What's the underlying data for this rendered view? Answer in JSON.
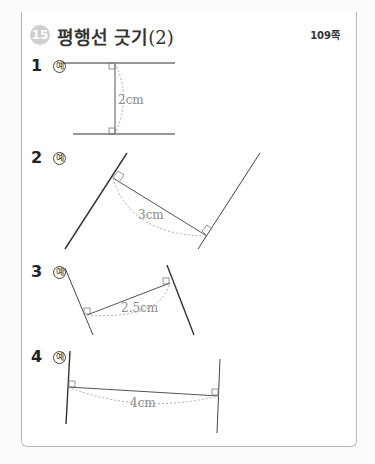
{
  "header": {
    "section_number": "15",
    "title": "평행선 긋기",
    "title_suffix": "(2)",
    "page_ref": "109쪽"
  },
  "problems": [
    {
      "number": "1",
      "example_mark": "예",
      "distance_label": "2cm"
    },
    {
      "number": "2",
      "example_mark": "예",
      "distance_label": "3cm"
    },
    {
      "number": "3",
      "example_mark": "예",
      "distance_label": "2.5cm"
    },
    {
      "number": "4",
      "example_mark": "예",
      "distance_label": "4cm"
    }
  ],
  "colors": {
    "header_band": "#a9a9a9",
    "section_circle": "#cfcfcf",
    "line": "#333333",
    "dashed_arc": "#a0a0a0"
  }
}
